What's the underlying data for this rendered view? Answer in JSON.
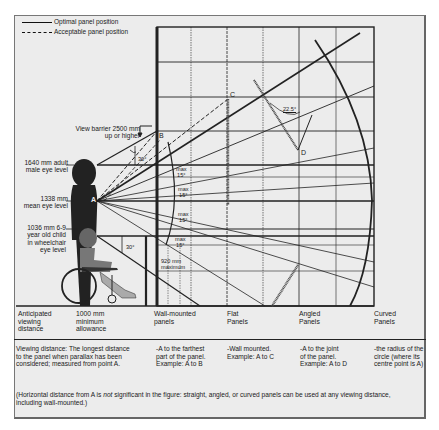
{
  "legend": {
    "optimal": "Optimal panel position",
    "acceptable": "Acceptable panel position"
  },
  "labels": {
    "view_barrier": [
      "View barrier 2500 mm",
      "up or higher"
    ],
    "adult_eye": [
      "1640 mm adult",
      "male eye level"
    ],
    "mean_eye": [
      "1338 mm",
      "mean eye level"
    ],
    "child_eye": [
      "1036 mm 6-9",
      "year old child",
      "in wheelchair",
      "eye level"
    ],
    "point_a": "A",
    "point_b": "B",
    "point_c": "C",
    "point_d": "D",
    "angle_30_top": "30°",
    "angle_30_bottom": "30°",
    "angle_22_5": "22.5°",
    "max_15": [
      "max",
      "15°"
    ],
    "max_920": [
      "920 mm",
      "maximum"
    ]
  },
  "categories": [
    {
      "label": [
        "Anticipated",
        "viewing",
        "distance"
      ]
    },
    {
      "label": [
        "1000 mm",
        "minimum",
        "allowance"
      ]
    },
    {
      "label": [
        "Wall-mounted",
        "panels"
      ]
    },
    {
      "label": [
        "Flat",
        "Panels"
      ]
    },
    {
      "label": [
        "Angled",
        "Panels"
      ]
    },
    {
      "label": [
        "Curved",
        "Panels"
      ]
    }
  ],
  "descriptions": [
    {
      "text": [
        "Viewing distance: The longest distance",
        "to the panel when parallax has been",
        "considered; measured from point A."
      ]
    },
    {
      "text": [
        "-A to the farthest",
        "part of the panel.",
        "Example: A to B"
      ]
    },
    {
      "text": [
        "-Wall mounted.",
        "Example: A to C"
      ]
    },
    {
      "text": [
        "-A to the joint",
        "of the panel.",
        "Example: A to D"
      ]
    },
    {
      "text": [
        "-the radius of the",
        "circle (where its",
        "centre point is A)"
      ]
    }
  ],
  "note": {
    "pre": "(Horizontal distance from A is ",
    "em": "not",
    "post": " significant in the figure: straight, angled, or curved panels can be used at any viewing distance, including wall-mounted.)"
  }
}
